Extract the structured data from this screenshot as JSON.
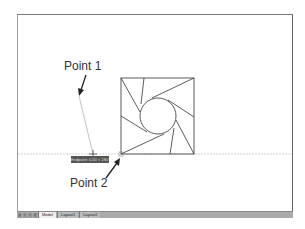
{
  "annotations": {
    "point1_label": "Point 1",
    "point2_label": "Point 2"
  },
  "tooltip": {
    "text": "Endpoint: 0.00 < 180°"
  },
  "tabs": {
    "nav_buttons": [
      "first-icon",
      "prev-icon",
      "next-icon",
      "last-icon"
    ],
    "items": [
      {
        "label": "Model",
        "active": true
      },
      {
        "label": "Layout1",
        "active": false
      },
      {
        "label": "Layout2",
        "active": false
      }
    ]
  },
  "colors": {
    "line": "#333333",
    "tracking_line": "#bbbbbb",
    "tooltip_bg": "#555555"
  }
}
